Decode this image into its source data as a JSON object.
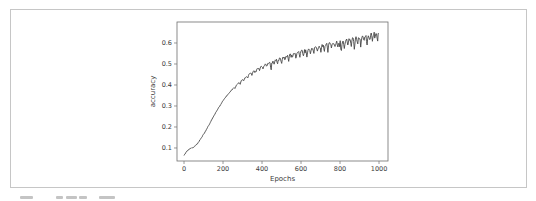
{
  "figure": {
    "frame_border_color": "#c6c6c6",
    "background_color": "#ffffff"
  },
  "chart_data": {
    "type": "line",
    "title": "",
    "xlabel": "Epochs",
    "ylabel": "accuracy",
    "x_ticks": [
      0,
      200,
      400,
      600,
      800,
      1000
    ],
    "y_ticks": [
      0.1,
      0.2,
      0.3,
      0.4,
      0.5,
      0.6
    ],
    "xlim": [
      -36,
      1046
    ],
    "ylim": [
      0.038,
      0.7
    ],
    "grid": false,
    "legend": "none",
    "line_color": "#474747",
    "axis_color": "#6e6e6e",
    "tick_label_color": "#3a3a3a",
    "series": [
      {
        "name": "training accuracy",
        "trend_points": [
          [
            0,
            0.065
          ],
          [
            15,
            0.085
          ],
          [
            30,
            0.097
          ],
          [
            50,
            0.103
          ],
          [
            70,
            0.122
          ],
          [
            90,
            0.15
          ],
          [
            110,
            0.18
          ],
          [
            130,
            0.213
          ],
          [
            150,
            0.248
          ],
          [
            170,
            0.28
          ],
          [
            190,
            0.31
          ],
          [
            210,
            0.338
          ],
          [
            230,
            0.36
          ],
          [
            250,
            0.382
          ],
          [
            270,
            0.4
          ],
          [
            290,
            0.418
          ],
          [
            310,
            0.433
          ],
          [
            330,
            0.448
          ],
          [
            350,
            0.461
          ],
          [
            370,
            0.473
          ],
          [
            390,
            0.485
          ],
          [
            420,
            0.499
          ],
          [
            450,
            0.511
          ],
          [
            480,
            0.522
          ],
          [
            510,
            0.532
          ],
          [
            540,
            0.543
          ],
          [
            570,
            0.552
          ],
          [
            600,
            0.56
          ],
          [
            640,
            0.571
          ],
          [
            680,
            0.581
          ],
          [
            720,
            0.59
          ],
          [
            760,
            0.598
          ],
          [
            800,
            0.606
          ],
          [
            840,
            0.614
          ],
          [
            880,
            0.622
          ],
          [
            920,
            0.631
          ],
          [
            960,
            0.641
          ],
          [
            1000,
            0.65
          ]
        ],
        "dip_spikes": [
          [
            262,
            0.01
          ],
          [
            288,
            0.012
          ],
          [
            306,
            0.01
          ],
          [
            327,
            0.014
          ],
          [
            348,
            0.012
          ],
          [
            368,
            0.016
          ],
          [
            388,
            0.012
          ],
          [
            405,
            0.018
          ],
          [
            425,
            0.015
          ],
          [
            446,
            0.045
          ],
          [
            462,
            0.018
          ],
          [
            480,
            0.022
          ],
          [
            500,
            0.03
          ],
          [
            518,
            0.02
          ],
          [
            537,
            0.028
          ],
          [
            556,
            0.022
          ],
          [
            574,
            0.03
          ],
          [
            594,
            0.024
          ],
          [
            612,
            0.028
          ],
          [
            630,
            0.035
          ],
          [
            648,
            0.025
          ],
          [
            665,
            0.032
          ],
          [
            684,
            0.022
          ],
          [
            702,
            0.03
          ],
          [
            720,
            0.026
          ],
          [
            738,
            0.034
          ],
          [
            756,
            0.024
          ],
          [
            775,
            0.03
          ],
          [
            790,
            0.022
          ],
          [
            806,
            0.05
          ],
          [
            822,
            0.03
          ],
          [
            840,
            0.026
          ],
          [
            858,
            0.034
          ],
          [
            874,
            0.056
          ],
          [
            890,
            0.028
          ],
          [
            906,
            0.032
          ],
          [
            922,
            0.026
          ],
          [
            938,
            0.048
          ],
          [
            952,
            0.03
          ],
          [
            966,
            0.036
          ],
          [
            980,
            0.028
          ],
          [
            992,
            0.04
          ]
        ],
        "noise": {
          "base_amplitude": 0.0015,
          "late_amplitude": 0.008,
          "ramp_start_epoch": 250
        }
      }
    ]
  },
  "caption_fragment": {
    "description": "partially cropped caption text at bottom edge of page",
    "marks": [
      [
        20,
        13
      ],
      [
        56,
        7
      ],
      [
        66,
        11
      ],
      [
        79,
        8
      ],
      [
        99,
        16
      ]
    ]
  }
}
